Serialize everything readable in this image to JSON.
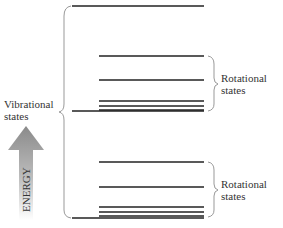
{
  "labels": {
    "vibrational": [
      "Vibrational",
      "states"
    ],
    "rotational_upper": [
      "Rotational",
      "states"
    ],
    "rotational_lower": [
      "Rotational",
      "states"
    ],
    "energy": "ENERGY"
  },
  "levels": {
    "long_lines_y": [
      6,
      111,
      218
    ],
    "upper_rotational_y": [
      56,
      80,
      101,
      106,
      110
    ],
    "lower_rotational_y": [
      162,
      187,
      207,
      212,
      216
    ]
  },
  "colors": {
    "line": "#222222",
    "brace": "#999999",
    "text": "#333333",
    "arrow_top": "#8a8a8a",
    "arrow_bottom": "#ffffff"
  }
}
